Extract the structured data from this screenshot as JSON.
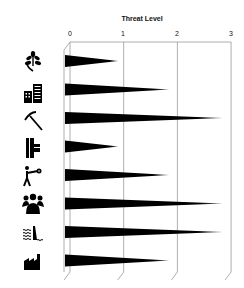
{
  "chart_data": {
    "type": "bar",
    "orientation": "horizontal",
    "style": "tapered-spike bars with 3D perspective grid",
    "title": "Threat Level",
    "xlabel": "Threat Level",
    "ylabel": "",
    "xlim": [
      0,
      3
    ],
    "ticks": [
      "0",
      "1",
      "2",
      "3"
    ],
    "grid": true,
    "legend": null,
    "categories": [
      "plants",
      "urban-development",
      "mining",
      "pipelines",
      "hunting",
      "human-population",
      "water-pollution",
      "industry"
    ],
    "category_icons": [
      "leaf-icon",
      "buildings-icon",
      "pickaxe-icon",
      "pipe-icon",
      "hunter-icon",
      "people-group-icon",
      "dam-water-icon",
      "factory-icon"
    ],
    "values": [
      0.9,
      1.85,
      2.85,
      0.9,
      1.85,
      2.85,
      2.85,
      1.85
    ],
    "bar_color": "#000000"
  }
}
